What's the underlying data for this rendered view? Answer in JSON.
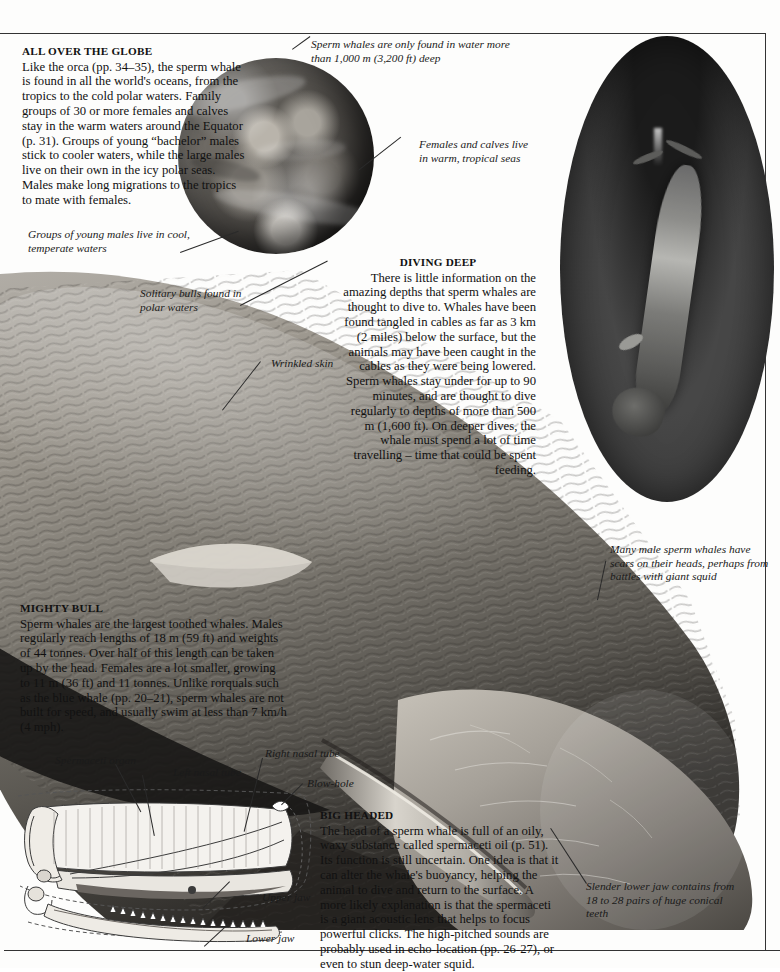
{
  "page": {
    "subject": "Sperm whale",
    "frame_color": "#333333",
    "background": "#fdfdfc"
  },
  "sections": [
    {
      "id": "all-over-the-globe",
      "heading": "ALL OVER THE GLOBE",
      "body": "Like the orca (pp. 34–35), the sperm whale is found in all the world's oceans, from the tropics to the cold polar waters. Family groups of 30 or more females and calves stay in the warm waters around the Equator (p. 31). Groups of young “bachelor” males stick to cooler waters, while the large males live on their own in the icy polar seas. Males make long migrations to the tropics to mate with females."
    },
    {
      "id": "diving-deep",
      "heading": "DIVING DEEP",
      "body": "There is little information on the amazing depths that sperm whales are thought to dive to. Whales have been found tangled in cables as far as 3 km (2 miles) below the surface, but the animals may have been caught in the cables as they were being lowered. Sperm whales stay under for up to 90 minutes, and are thought to dive regularly to depths of more than 500 m (1,600 ft). On deeper dives, the whale must spend a lot of time travelling – time that could be spent feeding."
    },
    {
      "id": "mighty-bull",
      "heading": "MIGHTY BULL",
      "body": "Sperm whales are the largest toothed whales. Males regularly reach lengths of 18 m (59 ft) and weights of 44 tonnes. Over half of this length can be taken up by the head. Females are a lot smaller, growing to 11 m (36 ft) and 11 tonnes. Unlike rorquals such as the blue whale (pp. 20–21), sperm whales are not built for speed, and usually swim at less than 7 km/h (4 mph)."
    },
    {
      "id": "big-headed",
      "heading": "BIG HEADED",
      "body": "The head of a sperm whale is full of an oily, waxy substance called spermaceti oil (p. 51). Its function is still uncertain. One idea is that it can alter the whale's buoyancy, helping the animal to dive and return to the surface. A more likely explanation is that the spermaceti is a giant acoustic lens that helps to focus powerful clicks. The high-pitched sounds are probably used in echo-location (pp. 26-27), or even to stun deep-water squid."
    }
  ],
  "captions": {
    "depth_water": "Sperm whales are only found in water more than 1,000 m (3,200 ft) deep",
    "females_calves": "Females and calves live in warm, tropical seas",
    "young_males": "Groups of young males live in cool, temperate waters",
    "solitary_bulls": "Solitary bulls found in polar waters",
    "wrinkled_skin": "Wrinkled skin",
    "male_scars": "Many male sperm whales have scars on their heads, perhaps from battles with giant squid",
    "slender_jaw": "Slender lower jaw contains from 18 to 28 pairs of huge conical teeth",
    "spermaceti_organ": "Spermaceti organ",
    "left_nasal_tube": "Left nasal tube",
    "right_nasal_tube": "Right nasal tube",
    "blow_hole": "Blow-hole",
    "upper_jaw": "Upper jaw",
    "lower_jaw": "Lower jaw"
  },
  "figures": {
    "globe": "earth-globe-photo",
    "diving_whale": "diving-sperm-whale-oval-photo",
    "whale_body": "sperm-whale-body-photo",
    "head_anatomy": "sperm-whale-head-cutaway-diagram"
  }
}
